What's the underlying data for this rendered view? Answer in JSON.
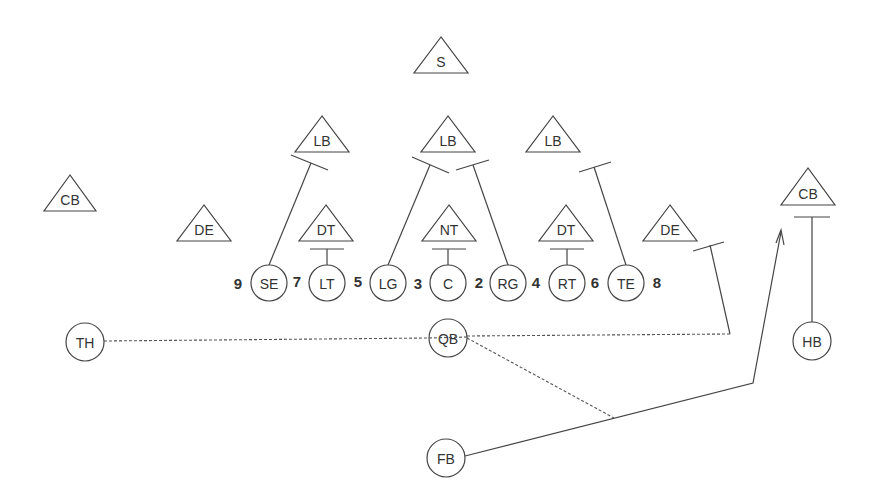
{
  "diagram": {
    "type": "football-play",
    "line_color": "#444444",
    "background": "#ffffff",
    "defense": [
      {
        "id": "s",
        "label": "S",
        "x": 441,
        "apex_y": 37,
        "base_y": 73,
        "half_w": 27
      },
      {
        "id": "lb-left",
        "label": "LB",
        "x": 322,
        "apex_y": 116,
        "base_y": 152,
        "half_w": 27
      },
      {
        "id": "lb-center",
        "label": "LB",
        "x": 448,
        "apex_y": 116,
        "base_y": 152,
        "half_w": 27
      },
      {
        "id": "lb-right",
        "label": "LB",
        "x": 553,
        "apex_y": 116,
        "base_y": 152,
        "half_w": 27
      },
      {
        "id": "cb-left",
        "label": "CB",
        "x": 70,
        "apex_y": 175,
        "base_y": 211,
        "half_w": 26
      },
      {
        "id": "cb-right",
        "label": "CB",
        "x": 808,
        "apex_y": 168,
        "base_y": 205,
        "half_w": 27
      },
      {
        "id": "de-left",
        "label": "DE",
        "x": 204,
        "apex_y": 205,
        "base_y": 241,
        "half_w": 27
      },
      {
        "id": "dt-left",
        "label": "DT",
        "x": 326,
        "apex_y": 205,
        "base_y": 241,
        "half_w": 27
      },
      {
        "id": "nt",
        "label": "NT",
        "x": 449,
        "apex_y": 205,
        "base_y": 241,
        "half_w": 27
      },
      {
        "id": "dt-right",
        "label": "DT",
        "x": 566,
        "apex_y": 205,
        "base_y": 241,
        "half_w": 27
      },
      {
        "id": "de-right",
        "label": "DE",
        "x": 670,
        "apex_y": 205,
        "base_y": 241,
        "half_w": 27
      }
    ],
    "offense": [
      {
        "id": "se",
        "label": "SE",
        "x": 269,
        "y": 283,
        "r": 18
      },
      {
        "id": "lt",
        "label": "LT",
        "x": 327,
        "y": 283,
        "r": 18
      },
      {
        "id": "lg",
        "label": "LG",
        "x": 388,
        "y": 283,
        "r": 18
      },
      {
        "id": "c",
        "label": "C",
        "x": 448,
        "y": 283,
        "r": 18
      },
      {
        "id": "rg",
        "label": "RG",
        "x": 508,
        "y": 283,
        "r": 18
      },
      {
        "id": "rt",
        "label": "RT",
        "x": 567,
        "y": 283,
        "r": 18
      },
      {
        "id": "te",
        "label": "TE",
        "x": 626,
        "y": 283,
        "r": 18
      },
      {
        "id": "th",
        "label": "TH",
        "x": 85,
        "y": 342,
        "r": 19
      },
      {
        "id": "qb",
        "label": "QB",
        "x": 448,
        "y": 338,
        "r": 19
      },
      {
        "id": "hb",
        "label": "HB",
        "x": 812,
        "y": 341,
        "r": 19
      },
      {
        "id": "fb",
        "label": "FB",
        "x": 446,
        "y": 458,
        "r": 19
      }
    ],
    "gap_numbers": [
      {
        "label": "9",
        "x": 238,
        "y": 283
      },
      {
        "label": "7",
        "x": 297,
        "y": 281
      },
      {
        "label": "5",
        "x": 358,
        "y": 281
      },
      {
        "label": "3",
        "x": 418,
        "y": 283
      },
      {
        "label": "2",
        "x": 479,
        "y": 282
      },
      {
        "label": "4",
        "x": 536,
        "y": 282
      },
      {
        "label": "6",
        "x": 595,
        "y": 282
      },
      {
        "label": "8",
        "x": 657,
        "y": 282
      }
    ],
    "blocks": [
      {
        "from": "se",
        "path": "M 269 265 L 311 163",
        "bar": "M 291 155 L 328 170"
      },
      {
        "from": "lt",
        "path": "M 327 265 L 327 249",
        "bar": "M 310 249 L 344 249"
      },
      {
        "from": "lg",
        "path": "M 388 265 L 430 165",
        "bar": "M 412 157 L 449 173"
      },
      {
        "from": "c",
        "path": "M 448 265 L 448 249",
        "bar": "M 432 249 L 466 249"
      },
      {
        "from": "rg",
        "path": "M 508 265 L 473 165",
        "bar": "M 456 170 L 489 160"
      },
      {
        "from": "rt",
        "path": "M 567 265 L 567 249",
        "bar": "M 550 249 L 584 249"
      },
      {
        "from": "te",
        "path": "M 626 265 L 594 167",
        "bar": "M 579 172 L 611 162"
      },
      {
        "from": "hb",
        "path": "M 812 322 L 812 217",
        "bar": "M 794 217 L 830 217"
      }
    ],
    "routes": [
      {
        "id": "fb-route",
        "style": "solid",
        "path": "M 465 456 L 753 383 L 781 232",
        "arrow": true
      },
      {
        "id": "pass-te-block",
        "style": "solid",
        "path": "M 710 245 L 730 334",
        "bar": "M 693 251 L 724 242"
      }
    ],
    "dashed_paths": [
      {
        "id": "th-to-qb-to-flat",
        "path": "M 104 341 L 429 338 M 467 336 L 730 334"
      },
      {
        "id": "qb-to-fb-route",
        "path": "M 467 338 L 614 418"
      }
    ]
  }
}
